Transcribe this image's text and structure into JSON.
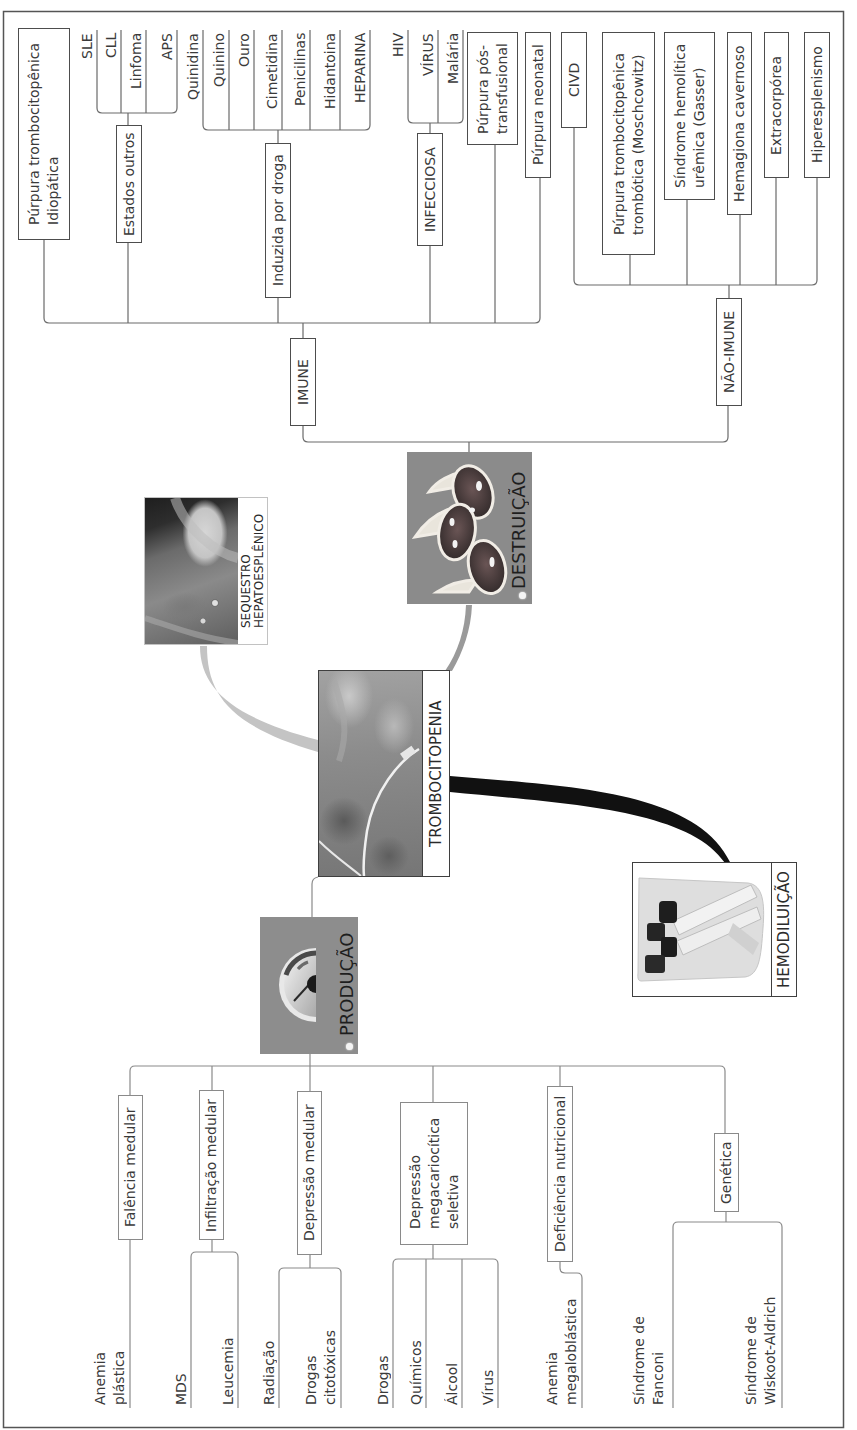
{
  "center": {
    "label": "TROMBOCITOPENIA"
  },
  "destruction": {
    "label": "DESTRUIÇÃO",
    "immune": {
      "label": "IMUNE",
      "children": [
        {
          "label": "Púrpura trombocitopênica\nIdiopática"
        },
        {
          "label": "Estados outros",
          "children": [
            "SLE",
            "CLL",
            "Linfoma",
            "APS"
          ]
        },
        {
          "label": "Induzida por droga",
          "children": [
            "Quinidina",
            "Quinino",
            "Ouro",
            "Cimetidina",
            "Penicilinas",
            "Hidantoina",
            "HEPARINA"
          ]
        },
        {
          "label": "INFECCIOSA",
          "children": [
            "HIV",
            "VÍRUS",
            "Malária"
          ]
        },
        {
          "label": "Púrpura pós-\ntransfusional"
        },
        {
          "label": "Púrpura neonatal"
        }
      ]
    },
    "non_immune": {
      "label": "NÃO-IMUNE",
      "children": [
        "CIVD",
        "Púrpura trombocitopênica\ntrombótica (Moschcowitz)",
        "Síndrome hemolítica\nurêmica (Gasser)",
        "Hemagiona cavernoso",
        "Extracorpórea",
        "Hiperesplenismo"
      ]
    }
  },
  "sequestration": {
    "label": "SEQUESTRO\nHEPATOESPLÊNICO"
  },
  "hemodilution": {
    "label": "HEMODILUIÇÃO"
  },
  "production": {
    "label": "PRODUÇÃO",
    "children": [
      {
        "label": "Falência medular",
        "children": [
          "Anemia\nplástica"
        ]
      },
      {
        "label": "Infiltração medular",
        "children": [
          "MDS",
          "Leucemia"
        ]
      },
      {
        "label": "Depressão medular",
        "children": [
          "Radiação",
          "Drogas\ncitotóxicas"
        ]
      },
      {
        "label": "Depressão\nmegacariocítica\nseletiva",
        "children": [
          "Drogas",
          "Químicos",
          "Álcool",
          "Vírus"
        ]
      },
      {
        "label": "Deficiência nutricional",
        "children": [
          "Anemia\nmegaloblástica"
        ]
      },
      {
        "label": "Genética",
        "children": [
          "Síndrome de\nFanconi",
          "Síndrome de\nWiskoot-Aldrich"
        ]
      }
    ]
  },
  "icons": {
    "center": "skin-bruise-photo",
    "destruction": "platelet-cells-illustration",
    "production": "gauge-icon",
    "sequestration": "surgery-photo",
    "hemodilution": "blood-tubes-photo"
  },
  "colors": {
    "connector": "#6a6a6a",
    "node_gray": "#8b8b8b",
    "hemodilution_link": "#111111",
    "sequestration_link": "#c4c4c4"
  }
}
